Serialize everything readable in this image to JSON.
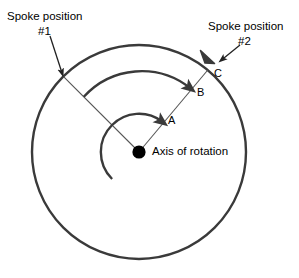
{
  "figure": {
    "title_visible": false,
    "background_color": "#ffffff",
    "stroke_color": "#3a3a3a",
    "thin_stroke_color": "#555555",
    "text_color": "#000000"
  },
  "labels": {
    "spoke1_line1": "Spoke position",
    "spoke1_line2": "#1",
    "spoke2_line1": "Spoke position",
    "spoke2_line2": "#2",
    "axis": "Axis of rotation",
    "arc_a": "A",
    "arc_b": "B",
    "arc_c": "C"
  },
  "geometry": {
    "center": {
      "x": 139,
      "y": 152
    },
    "outer_circle_radius": 107,
    "spoke1_angle_deg": 135,
    "spoke2_angle_deg": 50,
    "arc_a_radius": 38,
    "arc_b_radius": 78,
    "arc_c_radius": 107
  },
  "annotations": {
    "pointer1": {
      "from": {
        "x": 50,
        "y": 36
      },
      "to": {
        "x": 63,
        "y": 76
      }
    },
    "pointer2": {
      "from": {
        "x": 240,
        "y": 45
      },
      "to": {
        "x": 220,
        "y": 61
      }
    }
  },
  "icons": {
    "axis_dot": "filled-circle-icon",
    "arrowhead": "arrowhead-icon"
  }
}
